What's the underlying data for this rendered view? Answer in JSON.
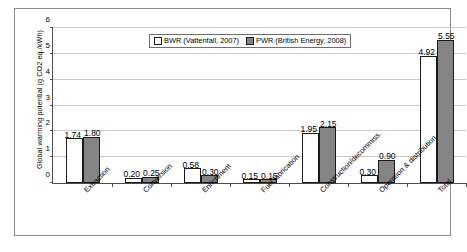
{
  "figure": {
    "ylabel": "Global warming potential (g CO2 eq./kWh)"
  },
  "legend": {
    "series": [
      {
        "label": "BWR (Vattenfall, 2007)",
        "color": "#ffffff"
      },
      {
        "label": "PWR (British Energy, 2008)",
        "color": "#848484"
      }
    ]
  },
  "chart_data": {
    "type": "bar",
    "title": "",
    "xlabel": "",
    "ylabel": "Global warming potential (g CO2 eq./kWh)",
    "ylim": [
      0,
      6
    ],
    "yticks": [
      "0",
      "1",
      "2",
      "3",
      "4",
      "5",
      "6"
    ],
    "grid": true,
    "legend_position": "top-center",
    "categories": [
      "Extraction",
      "Conversion",
      "Enrichment",
      "Fuel fabrication",
      "Construction/decommiss.",
      "Operation & distribution",
      "Total"
    ],
    "series": [
      {
        "name": "BWR (Vattenfall, 2007)",
        "color": "#ffffff",
        "values": [
          1.74,
          0.2,
          0.58,
          0.15,
          1.95,
          0.3,
          4.92
        ],
        "labels": [
          "1.74",
          "0.20",
          "0.58",
          "0.15",
          "1.95",
          "0.30",
          "4.92"
        ]
      },
      {
        "name": "PWR (British Energy, 2008)",
        "color": "#848484",
        "values": [
          1.8,
          0.25,
          0.3,
          0.15,
          2.15,
          0.9,
          5.55
        ],
        "labels": [
          "1.80",
          "0.25",
          "0.30",
          "0.15",
          "2.15",
          "0.90",
          "5.55"
        ]
      }
    ]
  }
}
